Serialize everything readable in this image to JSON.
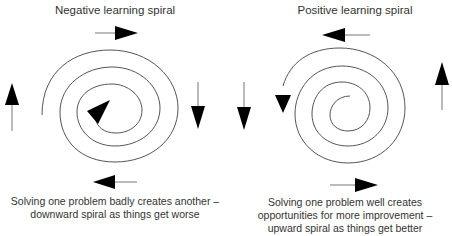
{
  "negative": {
    "title": "Negative learning spiral",
    "caption": "Solving one problem badly creates another – downward spiral as things get worse",
    "direction": "inward (clockwise)",
    "outer_arrows": [
      "right (top)",
      "down (right)",
      "left (bottom)",
      "up (left)"
    ]
  },
  "positive": {
    "title": "Positive learning spiral",
    "caption": "Solving one problem well creates opportunities for more improvement – upward spiral as things get better",
    "direction": "outward (counter-clockwise)",
    "outer_arrows": [
      "left (top)",
      "down (left)",
      "right (bottom)",
      "up (right)"
    ]
  },
  "colors": {
    "line": "#555555",
    "arrowhead": "#000000",
    "text": "#333333",
    "background": "#ffffff"
  }
}
